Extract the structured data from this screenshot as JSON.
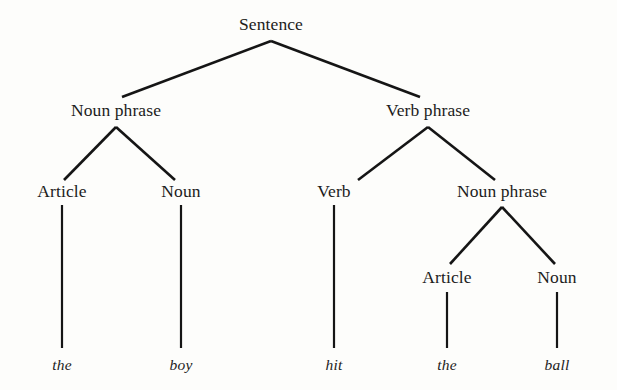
{
  "figure": {
    "type": "syntax-parse-tree",
    "sentence": "the boy hit the ball",
    "background_color": "#fdfdfb",
    "line_color": "#151515"
  },
  "nodes": {
    "root": {
      "label": "Sentence",
      "x": 271,
      "y": 25
    },
    "np_subject": {
      "label": "Noun phrase",
      "x": 116,
      "y": 111
    },
    "vp": {
      "label": "Verb phrase",
      "x": 428,
      "y": 111
    },
    "article_1": {
      "label": "Article",
      "x": 62,
      "y": 192
    },
    "noun_1": {
      "label": "Noun",
      "x": 181,
      "y": 192
    },
    "verb": {
      "label": "Verb",
      "x": 334,
      "y": 192
    },
    "np_object": {
      "label": "Noun phrase",
      "x": 502,
      "y": 192
    },
    "article_2": {
      "label": "Article",
      "x": 447,
      "y": 278
    },
    "noun_2": {
      "label": "Noun",
      "x": 557,
      "y": 278
    }
  },
  "leaves": [
    {
      "label": "the",
      "x": 62,
      "y": 365
    },
    {
      "label": "boy",
      "x": 181,
      "y": 365
    },
    {
      "label": "hit",
      "x": 334,
      "y": 365
    },
    {
      "label": "the",
      "x": 447,
      "y": 365
    },
    {
      "label": "ball",
      "x": 557,
      "y": 365
    }
  ],
  "edges": [
    {
      "name": "sentence-to-noun-phrase",
      "x1": 271,
      "y1": 41,
      "x2": 122,
      "y2": 97
    },
    {
      "name": "sentence-to-verb-phrase",
      "x1": 271,
      "y1": 41,
      "x2": 420,
      "y2": 97
    },
    {
      "name": "noun-phrase-to-article",
      "x1": 116,
      "y1": 127,
      "x2": 64,
      "y2": 180
    },
    {
      "name": "noun-phrase-to-noun",
      "x1": 116,
      "y1": 127,
      "x2": 175,
      "y2": 180
    },
    {
      "name": "verb-phrase-to-verb",
      "x1": 428,
      "y1": 127,
      "x2": 358,
      "y2": 180
    },
    {
      "name": "verb-phrase-to-noun-phrase",
      "x1": 428,
      "y1": 127,
      "x2": 495,
      "y2": 180
    },
    {
      "name": "object-noun-phrase-to-article",
      "x1": 502,
      "y1": 207,
      "x2": 450,
      "y2": 264
    },
    {
      "name": "object-noun-phrase-to-noun",
      "x1": 502,
      "y1": 207,
      "x2": 555,
      "y2": 264
    },
    {
      "name": "article-to-the",
      "x1": 62,
      "y1": 205,
      "x2": 62,
      "y2": 348
    },
    {
      "name": "noun-to-boy",
      "x1": 181,
      "y1": 205,
      "x2": 181,
      "y2": 348
    },
    {
      "name": "verb-to-hit",
      "x1": 334,
      "y1": 205,
      "x2": 334,
      "y2": 348
    },
    {
      "name": "article-to-the-2",
      "x1": 447,
      "y1": 292,
      "x2": 447,
      "y2": 348
    },
    {
      "name": "noun-to-ball",
      "x1": 557,
      "y1": 292,
      "x2": 557,
      "y2": 348
    }
  ]
}
